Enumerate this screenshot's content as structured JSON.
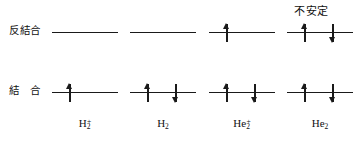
{
  "diagram": {
    "width": 363,
    "height": 142,
    "line_color": "#1a1a1a",
    "background_color": "#ffffff",
    "rows": {
      "antibonding": {
        "label": "反結合",
        "y": 32
      },
      "bonding": {
        "label": "結　合",
        "y": 92
      }
    },
    "annotation": {
      "text": "不安定",
      "target_column": "He2"
    },
    "columns": [
      {
        "id": "H2-plus",
        "formula_element": "H",
        "formula_sub": "2",
        "formula_sup": "+",
        "center_x": 85,
        "line_left": 52,
        "line_width": 66,
        "antibonding_electrons": [],
        "bonding_electrons": [
          "up"
        ]
      },
      {
        "id": "H2",
        "formula_element": "H",
        "formula_sub": "2",
        "formula_sup": "",
        "center_x": 163,
        "line_left": 130,
        "line_width": 66,
        "antibonding_electrons": [],
        "bonding_electrons": [
          "up",
          "down"
        ]
      },
      {
        "id": "He2-plus",
        "formula_element": "He",
        "formula_sub": "2",
        "formula_sup": "+",
        "center_x": 242,
        "line_left": 209,
        "line_width": 66,
        "antibonding_electrons": [
          "up"
        ],
        "bonding_electrons": [
          "up",
          "down"
        ]
      },
      {
        "id": "He2",
        "formula_element": "He",
        "formula_sub": "2",
        "formula_sup": "",
        "center_x": 320,
        "line_left": 287,
        "line_width": 66,
        "antibonding_electrons": [
          "up",
          "down"
        ],
        "bonding_electrons": [
          "up",
          "down"
        ]
      }
    ],
    "electron_slot_offsets": [
      -16,
      12
    ]
  }
}
